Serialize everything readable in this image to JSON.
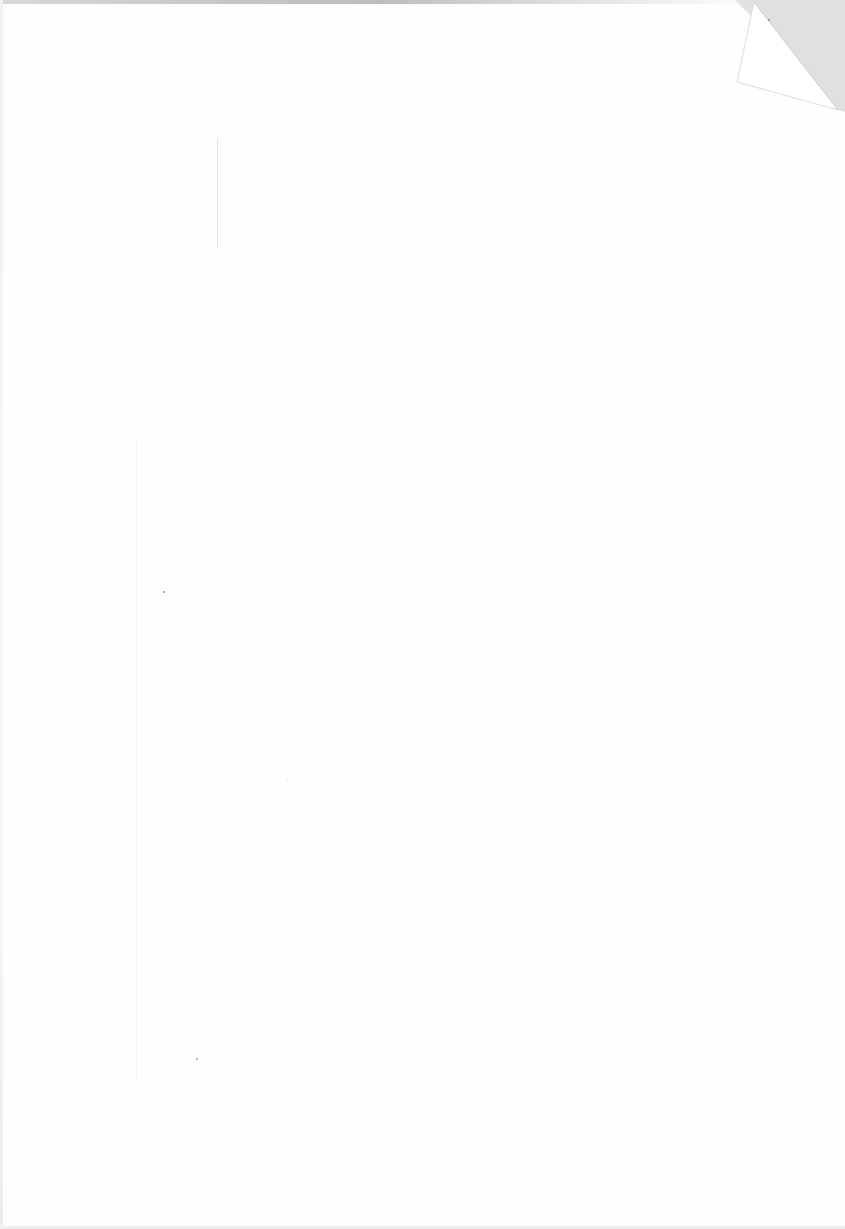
{
  "document": {
    "type": "scanned-blank-page",
    "text": "",
    "features": {
      "folded_corner": "top-right",
      "vertical_line": "faint line near top-left"
    },
    "colors": {
      "paper": "#fefefe",
      "corner_shadow": "#e2e2e2",
      "top_edge_smudge": "#bdbdbd"
    }
  }
}
